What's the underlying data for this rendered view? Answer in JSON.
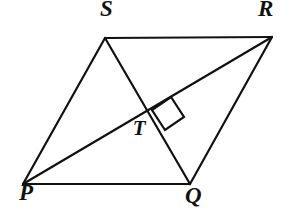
{
  "figure": {
    "kind": "geometry-diagram",
    "shape": "parallelogram",
    "canvas": {
      "width": 290,
      "height": 211
    },
    "background_color": "#ffffff",
    "line_color": "#111111",
    "line_width": 2,
    "points": {
      "P": {
        "x": 23,
        "y": 184
      },
      "Q": {
        "x": 190,
        "y": 184
      },
      "R": {
        "x": 272,
        "y": 37
      },
      "S": {
        "x": 105,
        "y": 38
      },
      "T": {
        "x": 150,
        "y": 113
      }
    },
    "labels": [
      {
        "id": "S",
        "text": "S",
        "x": 107,
        "y": 16
      },
      {
        "id": "R",
        "text": "R",
        "x": 265,
        "y": 16
      },
      {
        "id": "T",
        "text": "T",
        "x": 139,
        "y": 135
      },
      {
        "id": "P",
        "text": "P",
        "x": 26,
        "y": 200
      },
      {
        "id": "Q",
        "text": "Q",
        "x": 192,
        "y": 203
      }
    ],
    "segments": [
      {
        "id": "side-SR",
        "from": "S",
        "to": "R",
        "kind": "side"
      },
      {
        "id": "side-RQ",
        "from": "R",
        "to": "Q",
        "kind": "side"
      },
      {
        "id": "side-QP",
        "from": "Q",
        "to": "P",
        "kind": "side"
      },
      {
        "id": "side-PS",
        "from": "P",
        "to": "S",
        "kind": "side"
      },
      {
        "id": "diagonal-PR",
        "from": "P",
        "to": "R",
        "kind": "diagonal"
      },
      {
        "id": "diagonal-SQ",
        "from": "S",
        "to": "Q",
        "kind": "diagonal"
      }
    ],
    "right_angle_mark": {
      "at": "T",
      "quadrant": "upper-right",
      "size": 26,
      "corners": [
        {
          "x": 152,
          "y": 110
        },
        {
          "x": 171,
          "y": 97
        },
        {
          "x": 184,
          "y": 117
        },
        {
          "x": 165,
          "y": 130
        }
      ]
    }
  }
}
